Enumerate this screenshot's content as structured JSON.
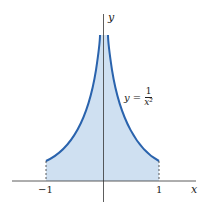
{
  "figure": {
    "axes": {
      "x_label": "x",
      "y_label": "y"
    },
    "ticks": {
      "left": "−1",
      "right": "1"
    },
    "equation": {
      "lhs": "y =",
      "numerator": "1",
      "denominator": "x²"
    },
    "colors": {
      "curve": "#2a63ad",
      "fill": "#cfe0f1",
      "axis": "#333333"
    }
  }
}
